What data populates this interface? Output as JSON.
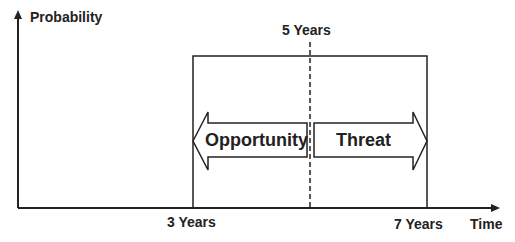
{
  "diagram": {
    "y_axis_label": "Probability",
    "x_axis_label": "Time",
    "top_marker": "5 Years",
    "x_ticks": [
      "3 Years",
      "7 Years"
    ],
    "left_arrow": "Opportunity",
    "right_arrow": "Threat"
  },
  "colors": {
    "line": "#222222",
    "background": "#ffffff"
  }
}
